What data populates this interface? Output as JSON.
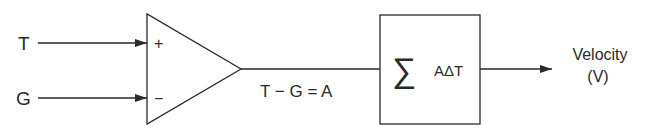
{
  "diagram": {
    "inputs": [
      {
        "label": "T",
        "sign": "+"
      },
      {
        "label": "G",
        "sign": "−"
      }
    ],
    "comparator_output_label": "T − G = A",
    "integrator": {
      "symbol": "∑",
      "expression": "AΔT"
    },
    "output": {
      "label_line1": "Velocity",
      "label_line2": "(V)"
    },
    "colors": {
      "stroke": "#2a2a2a",
      "background": "#ffffff"
    }
  }
}
